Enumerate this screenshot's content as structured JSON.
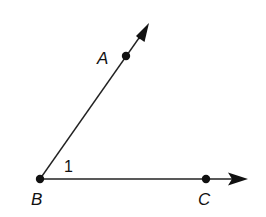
{
  "diagram": {
    "points": {
      "A": {
        "label": "A",
        "x": 126,
        "y": 56
      },
      "B": {
        "label": "B",
        "x": 40,
        "y": 179
      },
      "C": {
        "label": "C",
        "x": 206,
        "y": 179
      }
    },
    "rays": [
      {
        "name": "ray-BA",
        "from": "B",
        "through": "A",
        "arrow_tip": [
          149,
          23
        ]
      },
      {
        "name": "ray-BC",
        "from": "B",
        "through": "C",
        "arrow_tip": [
          248,
          179
        ]
      }
    ],
    "angle_label": "1",
    "colors": {
      "stroke": "#222222",
      "background": "#ffffff"
    }
  }
}
